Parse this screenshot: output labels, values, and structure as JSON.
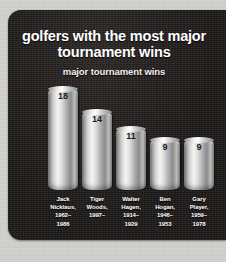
{
  "theme": {
    "panel_bg": "#231f1f",
    "mat_bg": "#d2d2d0",
    "title_color": "#ffffff",
    "value_color": "#1b1b1b",
    "bar_light": "#f4f4f2",
    "bar_dark": "#6d6d6d"
  },
  "chart_data": {
    "type": "bar",
    "title": "golfers with the most major tournament wins",
    "subtitle": "major tournament wins",
    "xlabel": "",
    "ylabel": "major tournament wins",
    "ylim": [
      0,
      18
    ],
    "grid": false,
    "legend": false,
    "categories": [
      "Jack Nicklaus, 1962–1986",
      "Tiger Woods, 1997–",
      "Walter Hagen, 1914–1929",
      "Ben Hogan, 1946–1953",
      "Gary Player, 1959–1978"
    ],
    "values": [
      18,
      14,
      11,
      9,
      9
    ],
    "bars": [
      {
        "value": 18,
        "value_label": "18",
        "label_lines": [
          "Jack",
          "Nicklaus,",
          "1962–",
          "1986"
        ],
        "name": "Jack Nicklaus",
        "years": "1962–1986"
      },
      {
        "value": 14,
        "value_label": "14",
        "label_lines": [
          "Tiger",
          "Woods,",
          "1997–"
        ],
        "name": "Tiger Woods",
        "years": "1997–"
      },
      {
        "value": 11,
        "value_label": "11",
        "label_lines": [
          "Walter",
          "Hagen,",
          "1914–",
          "1929"
        ],
        "name": "Walter Hagen",
        "years": "1914–1929"
      },
      {
        "value": 9,
        "value_label": "9",
        "label_lines": [
          "Ben",
          "Hogan,",
          "1946–",
          "1953"
        ],
        "name": "Ben Hogan",
        "years": "1946–1953"
      },
      {
        "value": 9,
        "value_label": "9",
        "label_lines": [
          "Gary",
          "Player,",
          "1959–",
          "1978"
        ],
        "name": "Gary Player",
        "years": "1959–1978"
      }
    ]
  }
}
